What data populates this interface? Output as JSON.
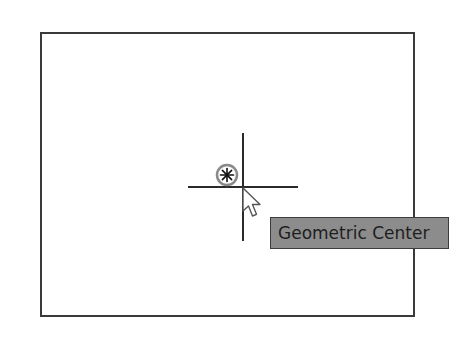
{
  "drawing": {
    "rectangle": {
      "stroke": "#3a3a3a",
      "fill": "#ffffff"
    },
    "crosshair": {
      "color": "#2a2a2a"
    },
    "center_marker": {
      "icon": "geometric-center-snap-icon",
      "color": "#8a8a8a",
      "glyph_color": "#111111"
    },
    "cursor": {
      "icon": "arrow-cursor-icon"
    }
  },
  "tooltip": {
    "label": "Geometric Center",
    "background": "#8c8c8c",
    "border": "#3c3c3c",
    "text_color": "#1e1e1e"
  }
}
